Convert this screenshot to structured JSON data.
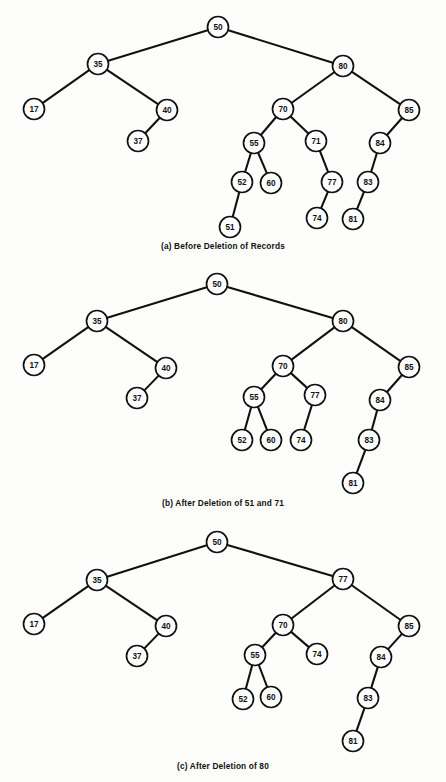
{
  "figure": {
    "background_color": "#fdfdfc",
    "ink_color": "#111111",
    "node_radius": 10.5
  },
  "panels": [
    {
      "id": "a",
      "caption": "(a) Before Deletion of Records",
      "nodes": [
        {
          "label": "50",
          "x": 218,
          "y": 27
        },
        {
          "label": "35",
          "x": 98,
          "y": 64
        },
        {
          "label": "80",
          "x": 343,
          "y": 66
        },
        {
          "label": "17",
          "x": 34,
          "y": 109
        },
        {
          "label": "40",
          "x": 167,
          "y": 110
        },
        {
          "label": "70",
          "x": 283,
          "y": 109
        },
        {
          "label": "85",
          "x": 409,
          "y": 110
        },
        {
          "label": "37",
          "x": 138,
          "y": 141
        },
        {
          "label": "55",
          "x": 254,
          "y": 143
        },
        {
          "label": "71",
          "x": 316,
          "y": 141
        },
        {
          "label": "84",
          "x": 380,
          "y": 143
        },
        {
          "label": "52",
          "x": 242,
          "y": 182
        },
        {
          "label": "60",
          "x": 271,
          "y": 183
        },
        {
          "label": "77",
          "x": 332,
          "y": 182
        },
        {
          "label": "83",
          "x": 368,
          "y": 182
        },
        {
          "label": "51",
          "x": 230,
          "y": 227
        },
        {
          "label": "74",
          "x": 317,
          "y": 218
        },
        {
          "label": "81",
          "x": 353,
          "y": 219
        }
      ],
      "edges": [
        [
          "50",
          "35"
        ],
        [
          "50",
          "80"
        ],
        [
          "35",
          "17"
        ],
        [
          "35",
          "40"
        ],
        [
          "40",
          "37"
        ],
        [
          "80",
          "70"
        ],
        [
          "80",
          "85"
        ],
        [
          "70",
          "55"
        ],
        [
          "70",
          "71"
        ],
        [
          "55",
          "52"
        ],
        [
          "55",
          "60"
        ],
        [
          "52",
          "51"
        ],
        [
          "71",
          "77"
        ],
        [
          "77",
          "74"
        ],
        [
          "85",
          "84"
        ],
        [
          "84",
          "83"
        ],
        [
          "83",
          "81"
        ]
      ]
    },
    {
      "id": "b",
      "caption": "(b) After Deletion of 51 and 71",
      "nodes": [
        {
          "label": "50",
          "x": 217,
          "y": 284
        },
        {
          "label": "35",
          "x": 97,
          "y": 321
        },
        {
          "label": "80",
          "x": 343,
          "y": 321
        },
        {
          "label": "17",
          "x": 34,
          "y": 365
        },
        {
          "label": "40",
          "x": 166,
          "y": 368
        },
        {
          "label": "70",
          "x": 283,
          "y": 366
        },
        {
          "label": "85",
          "x": 409,
          "y": 367
        },
        {
          "label": "37",
          "x": 137,
          "y": 398
        },
        {
          "label": "55",
          "x": 254,
          "y": 397
        },
        {
          "label": "77",
          "x": 315,
          "y": 395
        },
        {
          "label": "84",
          "x": 380,
          "y": 400
        },
        {
          "label": "52",
          "x": 242,
          "y": 440
        },
        {
          "label": "60",
          "x": 271,
          "y": 440
        },
        {
          "label": "74",
          "x": 301,
          "y": 440
        },
        {
          "label": "83",
          "x": 369,
          "y": 440
        },
        {
          "label": "81",
          "x": 353,
          "y": 483
        }
      ],
      "edges": [
        [
          "50",
          "35"
        ],
        [
          "50",
          "80"
        ],
        [
          "35",
          "17"
        ],
        [
          "35",
          "40"
        ],
        [
          "40",
          "37"
        ],
        [
          "80",
          "70"
        ],
        [
          "80",
          "85"
        ],
        [
          "70",
          "55"
        ],
        [
          "70",
          "77"
        ],
        [
          "55",
          "52"
        ],
        [
          "55",
          "60"
        ],
        [
          "77",
          "74"
        ],
        [
          "85",
          "84"
        ],
        [
          "84",
          "83"
        ],
        [
          "83",
          "81"
        ]
      ]
    },
    {
      "id": "c",
      "caption": "(c) After Deletion of 80",
      "nodes": [
        {
          "label": "50",
          "x": 217,
          "y": 542
        },
        {
          "label": "35",
          "x": 97,
          "y": 580
        },
        {
          "label": "77",
          "x": 343,
          "y": 579
        },
        {
          "label": "17",
          "x": 34,
          "y": 624
        },
        {
          "label": "40",
          "x": 166,
          "y": 626
        },
        {
          "label": "70",
          "x": 283,
          "y": 625
        },
        {
          "label": "85",
          "x": 409,
          "y": 626
        },
        {
          "label": "37",
          "x": 137,
          "y": 656
        },
        {
          "label": "55",
          "x": 255,
          "y": 655
        },
        {
          "label": "74",
          "x": 317,
          "y": 654
        },
        {
          "label": "84",
          "x": 381,
          "y": 657
        },
        {
          "label": "52",
          "x": 243,
          "y": 699
        },
        {
          "label": "60",
          "x": 271,
          "y": 697
        },
        {
          "label": "83",
          "x": 368,
          "y": 698
        },
        {
          "label": "81",
          "x": 353,
          "y": 741
        }
      ],
      "edges": [
        [
          "50",
          "35"
        ],
        [
          "50",
          "77"
        ],
        [
          "35",
          "17"
        ],
        [
          "35",
          "40"
        ],
        [
          "40",
          "37"
        ],
        [
          "77",
          "70"
        ],
        [
          "77",
          "85"
        ],
        [
          "70",
          "55"
        ],
        [
          "70",
          "74"
        ],
        [
          "55",
          "52"
        ],
        [
          "55",
          "60"
        ],
        [
          "85",
          "84"
        ],
        [
          "84",
          "83"
        ],
        [
          "83",
          "81"
        ]
      ]
    }
  ]
}
